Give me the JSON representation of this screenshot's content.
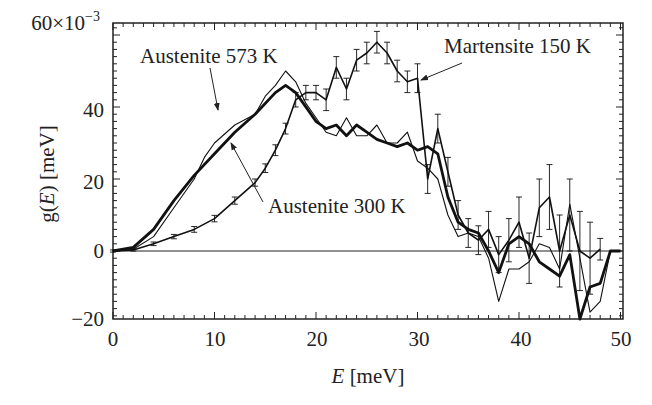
{
  "chart_data": {
    "type": "line",
    "title": "",
    "xlabel": "E [meV]",
    "ylabel": "g(E) [meV]",
    "y_scale_note": "×10^-3",
    "xlim": [
      0,
      50
    ],
    "ylim": [
      -20,
      63
    ],
    "x_ticks": [
      0,
      10,
      20,
      30,
      40,
      50
    ],
    "x_tick_labels": [
      "0",
      "10",
      "20",
      "30",
      "40",
      "50"
    ],
    "y_ticks": [
      -20,
      0,
      20,
      40,
      60
    ],
    "y_tick_labels": [
      "−20",
      "0",
      "20",
      "40",
      "60×10⁻³"
    ],
    "grid": false,
    "legend": "none (inline arrow annotations)",
    "zero_line": true,
    "series": [
      {
        "name": "Austenite 573 K",
        "style": "thin",
        "x": [
          0,
          2,
          4,
          6,
          8,
          9,
          10,
          12,
          14,
          15,
          16,
          17,
          18,
          19,
          20,
          21,
          22,
          23,
          24,
          25,
          26,
          27,
          28,
          29,
          30,
          31,
          32,
          33,
          34,
          35,
          36,
          37,
          38,
          39,
          40,
          41,
          42,
          43,
          44,
          45,
          46,
          47,
          48,
          49,
          50
        ],
        "values": [
          0,
          0.5,
          4,
          12,
          20,
          26,
          30,
          35,
          38,
          43,
          46,
          50,
          47,
          41,
          37,
          33,
          32,
          37,
          32,
          32,
          35,
          30,
          30,
          33,
          25,
          23,
          20,
          10,
          4,
          5,
          4,
          -2,
          -14,
          -5,
          -5,
          -3,
          2,
          1,
          -5,
          13,
          -2,
          -17,
          -14,
          0,
          0
        ]
      },
      {
        "name": "Austenite 300 K",
        "style": "thick",
        "x": [
          0,
          2,
          4,
          6,
          8,
          10,
          12,
          14,
          16,
          17,
          18,
          19,
          20,
          21,
          22,
          23,
          24,
          25,
          26,
          27,
          28,
          29,
          30,
          31,
          32,
          33,
          34,
          35,
          36,
          37,
          38,
          39,
          40,
          41,
          42,
          43,
          44,
          45,
          46,
          47,
          48,
          49,
          50
        ],
        "values": [
          0,
          1,
          6,
          14,
          21,
          27,
          33,
          38,
          44,
          46,
          44,
          40,
          36,
          34,
          35,
          32,
          35,
          33,
          31,
          30,
          29,
          30,
          28,
          29,
          27,
          15,
          8,
          6,
          5,
          0,
          -6,
          2,
          4,
          2,
          -3,
          -5,
          -7,
          -1,
          -20,
          -10,
          -9,
          0,
          0
        ]
      },
      {
        "name": "Martensite 150 K",
        "style": "error-bars",
        "x": [
          0,
          2,
          4,
          6,
          8,
          10,
          12,
          14,
          15,
          16,
          17,
          18,
          19,
          20,
          21,
          22,
          23,
          24,
          25,
          26,
          27,
          28,
          29,
          30,
          31,
          32,
          33,
          34,
          35,
          36,
          37,
          38,
          39,
          40,
          41,
          42,
          43,
          44,
          45,
          46,
          47,
          48
        ],
        "values": [
          0,
          0.3,
          2,
          4,
          6,
          9,
          14,
          19,
          23,
          28,
          34,
          42,
          44,
          44,
          42,
          51,
          45,
          53,
          55,
          58,
          55,
          50,
          47,
          48,
          20,
          34,
          22,
          10,
          5,
          3,
          6,
          -1,
          3,
          8,
          -2,
          12,
          15,
          0,
          10,
          0,
          -2,
          0.5
        ],
        "errors": [
          0.3,
          0.3,
          0.5,
          0.6,
          0.8,
          0.9,
          1,
          1,
          1.2,
          1.5,
          1.5,
          2,
          2,
          2,
          3,
          3,
          3,
          3,
          3,
          3,
          3,
          3,
          3,
          4,
          4,
          4,
          4,
          4,
          4,
          4,
          5,
          5,
          6,
          7,
          7,
          8,
          9,
          10,
          10,
          11,
          10,
          3
        ]
      }
    ],
    "annotations": [
      {
        "text": "Austenite 573 K",
        "points_to": "Austenite 573 K",
        "at_x": 10.2,
        "at_y": 38
      },
      {
        "text": "Austenite 300 K",
        "points_to": "Austenite 300 K",
        "at_x": 11.5,
        "at_y": 30.5
      },
      {
        "text": "Martensite 150 K",
        "points_to": "Martensite 150 K",
        "at_x": 30,
        "at_y": 48
      }
    ]
  },
  "labels": {
    "y_top": "60×10",
    "y_top_exp": "−3",
    "y40": "40",
    "y20": "20",
    "y0": "0",
    "ym20": "−20",
    "x0": "0",
    "x10": "10",
    "x20": "20",
    "x30": "30",
    "x40": "40",
    "x50": "50",
    "xlabel_var": "E",
    "xlabel_unit": " [meV]",
    "ylabel_g": "g(",
    "ylabel_var": "E",
    "ylabel_unit": ") [meV]",
    "annot_573": "Austenite 573 K",
    "annot_300": "Austenite 300 K",
    "annot_150": "Martensite 150 K"
  }
}
